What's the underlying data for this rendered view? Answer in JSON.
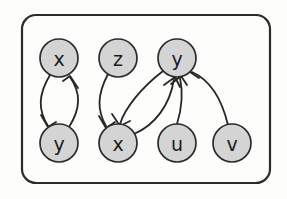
{
  "figure": {
    "name": "directed-graph-diagram",
    "background_color": "#fdfdfc",
    "frame": {
      "name": "rounded-border",
      "x": 22,
      "y": 15,
      "width": 248,
      "height": 168,
      "corner_radius": 14,
      "stroke_color": "#2b2b2b"
    }
  },
  "style": {
    "node_fill": "#d4d4d4",
    "node_stroke": "#2b2b2b",
    "edge_stroke": "#262626",
    "label_color": "#1a1a1a",
    "node_radius": 19
  },
  "graph": {
    "type": "directed",
    "nodes": [
      {
        "id": "n1",
        "label": "x",
        "cx": 59,
        "cy": 58,
        "row": "top"
      },
      {
        "id": "n2",
        "label": "z",
        "cx": 118,
        "cy": 58,
        "row": "top"
      },
      {
        "id": "n3",
        "label": "y",
        "cx": 177,
        "cy": 58,
        "row": "top"
      },
      {
        "id": "n4",
        "label": "y",
        "cx": 59,
        "cy": 143,
        "row": "bottom"
      },
      {
        "id": "n5",
        "label": "x",
        "cx": 118,
        "cy": 143,
        "row": "bottom"
      },
      {
        "id": "n6",
        "label": "u",
        "cx": 177,
        "cy": 143,
        "row": "bottom"
      },
      {
        "id": "n7",
        "label": "v",
        "cx": 232,
        "cy": 143,
        "row": "bottom"
      }
    ],
    "edges": [
      {
        "id": "e1",
        "from": "n1",
        "to": "n4",
        "label": "x-to-y",
        "shape": "curve-left"
      },
      {
        "id": "e2",
        "from": "n4",
        "to": "n1",
        "label": "y-to-x",
        "shape": "curve-right"
      },
      {
        "id": "e3",
        "from": "n2",
        "to": "n5",
        "label": "z-to-x",
        "shape": "curve-left"
      },
      {
        "id": "e4",
        "from": "n3",
        "to": "n5",
        "label": "y-to-x",
        "shape": "curve-left"
      },
      {
        "id": "e5",
        "from": "n5",
        "to": "n3",
        "label": "x-to-y",
        "shape": "curve-right"
      },
      {
        "id": "e6",
        "from": "n6",
        "to": "n3",
        "label": "u-to-y",
        "shape": "curve-slight"
      },
      {
        "id": "e7",
        "from": "n7",
        "to": "n3",
        "label": "v-to-y",
        "shape": "curve-wide"
      }
    ],
    "node_count": 7,
    "edge_count": 7
  }
}
